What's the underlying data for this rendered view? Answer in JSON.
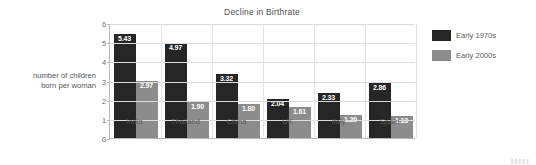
{
  "chart_data": {
    "type": "bar",
    "title": "Decline in Birthrate",
    "xlabel": "",
    "ylabel": "number of children born per woman",
    "ylabel_lines": [
      "number of children",
      "born per woman"
    ],
    "categories": [
      "India",
      "Thailand",
      "China",
      "UK",
      "Italy",
      "Spain"
    ],
    "series": [
      {
        "name": "Early 1970s",
        "color": "#262626",
        "values": [
          5.43,
          4.97,
          3.32,
          2.04,
          2.33,
          2.86
        ],
        "labels": [
          "5.43",
          "4.97",
          "3.32",
          "2.04",
          "2.33",
          "2.86"
        ]
      },
      {
        "name": "Early 2000s",
        "color": "#8c8c8c",
        "values": [
          2.97,
          1.9,
          1.8,
          1.61,
          1.2,
          1.13
        ],
        "labels": [
          "2.97",
          "1.90",
          "1.80",
          "1.61",
          "1.20",
          "1.13"
        ]
      }
    ],
    "ylim": [
      0,
      6
    ],
    "yticks": [
      0,
      1,
      2,
      3,
      4,
      5,
      6
    ],
    "ytick_labels": [
      "0",
      "1",
      "2",
      "3",
      "4",
      "5",
      "6"
    ],
    "grid": true,
    "legend_position": "right",
    "value_label_color": "#ffffff",
    "axis_color": "#b9b9b9",
    "gridline_color": "#dcdcdc"
  },
  "watermark": {
    "text": "‖‖‖‖‖"
  }
}
